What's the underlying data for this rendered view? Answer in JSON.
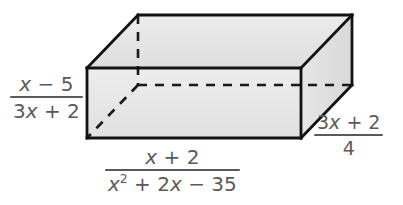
{
  "figure": {
    "shape": "rectangular-prism",
    "projection": "oblique",
    "colors": {
      "face_front": "#e9e9e9",
      "face_top": "#e4e4e4",
      "face_right": "#dedede",
      "edge_visible": "#111111",
      "edge_hidden": "#111111",
      "text": "#5a5a5a",
      "background": "#ffffff"
    }
  },
  "labels": {
    "height": {
      "position": "left",
      "role": "height-dimension",
      "expression": "(x - 5)/(3x + 2)",
      "numerator": "x − 5",
      "denominator": "3x + 2",
      "num_parts": {
        "var": "x",
        "rest": " − 5"
      },
      "den_parts": {
        "coef": "3",
        "var": "x",
        "rest": " + 2"
      }
    },
    "width": {
      "position": "bottom",
      "role": "length-dimension",
      "expression": "(x + 2)/(x^2 + 2x - 35)",
      "numerator": "x + 2",
      "denominator": "x² + 2x − 35",
      "num_parts": {
        "var": "x",
        "rest": " + 2"
      },
      "den_parts": {
        "var1": "x",
        "exp": "2",
        "mid": " + 2",
        "var2": "x",
        "rest": " − 35"
      }
    },
    "depth": {
      "position": "right",
      "role": "depth-dimension",
      "expression": "(3x + 2)/4",
      "numerator": "3x + 2",
      "denominator": "4",
      "num_parts": {
        "coef": "3",
        "var": "x",
        "rest": " + 2"
      }
    }
  }
}
